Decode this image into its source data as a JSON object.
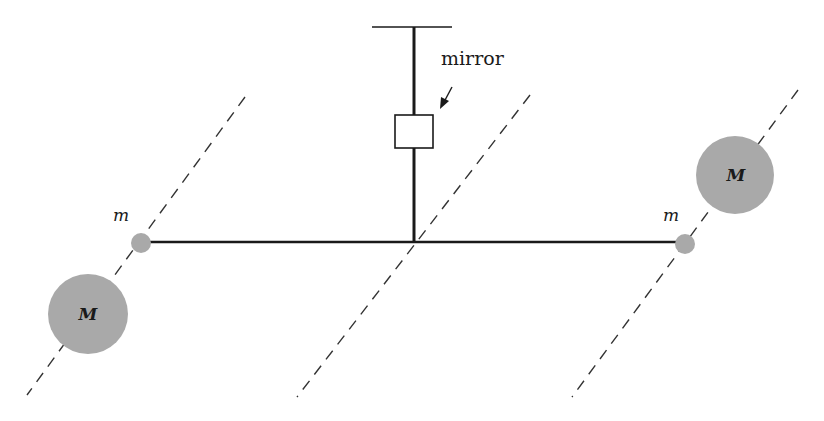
{
  "diagram": {
    "colors": {
      "background": "#ffffff",
      "line": "#1a1a1a",
      "mass_fill": "#a9a9a9",
      "dashed": "#333333"
    },
    "labels": {
      "mirror": "mirror",
      "small_mass_left": "m",
      "small_mass_right": "m",
      "large_mass_left": "M",
      "large_mass_right": "M"
    },
    "elements": {
      "suspension_bar": {
        "x1": 372,
        "x2": 452,
        "y": 27
      },
      "fiber": {
        "x": 414,
        "y1": 27,
        "y2": 242
      },
      "mirror_box": {
        "x": 395,
        "y": 115,
        "w": 38,
        "h": 33
      },
      "beam": {
        "x1": 141,
        "x2": 685,
        "y": 242
      },
      "small_masses": [
        {
          "cx": 141,
          "cy": 243,
          "r": 10
        },
        {
          "cx": 685,
          "cy": 244,
          "r": 10
        }
      ],
      "large_masses": [
        {
          "cx": 88,
          "cy": 314,
          "r": 40
        },
        {
          "cx": 735,
          "cy": 175,
          "r": 39
        }
      ],
      "dashed_lines": [
        {
          "x1": 245,
          "y1": 97,
          "x2": 27,
          "y2": 395
        },
        {
          "x1": 530,
          "y1": 95,
          "x2": 297,
          "y2": 397
        },
        {
          "x1": 798,
          "y1": 90,
          "x2": 572,
          "y2": 397
        }
      ]
    }
  }
}
